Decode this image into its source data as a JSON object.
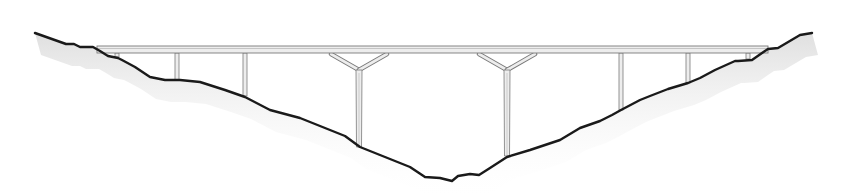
{
  "diagram": {
    "type": "bridge-elevation",
    "colors": {
      "background": "#ffffff",
      "terrain_line": "#1a1a1a",
      "terrain_shadow": "#e4e4e4",
      "structure_fill": "#ededed",
      "structure_stroke": "#7a7a7a"
    },
    "deck": {
      "x_start": 97,
      "x_end": 768,
      "y_top": 46,
      "y_bottom": 53
    },
    "piers": [
      {
        "id": "abutment-left",
        "kind": "column",
        "x": 117,
        "base_y": 57
      },
      {
        "id": "pier-1",
        "kind": "column",
        "x": 177,
        "base_y": 80
      },
      {
        "id": "pier-2",
        "kind": "column",
        "x": 245,
        "base_y": 96
      },
      {
        "id": "pier-3",
        "kind": "y-pier",
        "x": 359,
        "base_y": 147
      },
      {
        "id": "pier-4",
        "kind": "y-pier",
        "x": 507,
        "base_y": 156
      },
      {
        "id": "pier-5",
        "kind": "column",
        "x": 621,
        "base_y": 110
      },
      {
        "id": "pier-6",
        "kind": "column",
        "x": 688,
        "base_y": 83
      },
      {
        "id": "abutment-right",
        "kind": "column",
        "x": 748,
        "base_y": 59
      }
    ],
    "terrain_points": [
      [
        35,
        33
      ],
      [
        66,
        44
      ],
      [
        74,
        44
      ],
      [
        80,
        47
      ],
      [
        93,
        47
      ],
      [
        100,
        51
      ],
      [
        108,
        56
      ],
      [
        118,
        58
      ],
      [
        122,
        60
      ],
      [
        135,
        67
      ],
      [
        150,
        77
      ],
      [
        165,
        80
      ],
      [
        180,
        80
      ],
      [
        200,
        82
      ],
      [
        225,
        90
      ],
      [
        245,
        97
      ],
      [
        270,
        110
      ],
      [
        300,
        118
      ],
      [
        320,
        126
      ],
      [
        345,
        136
      ],
      [
        360,
        147
      ],
      [
        385,
        157
      ],
      [
        410,
        167
      ],
      [
        425,
        177
      ],
      [
        440,
        178
      ],
      [
        452,
        181
      ],
      [
        458,
        176
      ],
      [
        470,
        174
      ],
      [
        479,
        175
      ],
      [
        490,
        168
      ],
      [
        507,
        157
      ],
      [
        530,
        150
      ],
      [
        560,
        140
      ],
      [
        580,
        128
      ],
      [
        600,
        121
      ],
      [
        612,
        115
      ],
      [
        621,
        110
      ],
      [
        640,
        100
      ],
      [
        650,
        96
      ],
      [
        668,
        89
      ],
      [
        688,
        83
      ],
      [
        700,
        78
      ],
      [
        715,
        70
      ],
      [
        735,
        61
      ],
      [
        738,
        61
      ],
      [
        752,
        60
      ],
      [
        762,
        53
      ],
      [
        768,
        49
      ],
      [
        778,
        48
      ],
      [
        800,
        35
      ],
      [
        812,
        33
      ]
    ]
  }
}
